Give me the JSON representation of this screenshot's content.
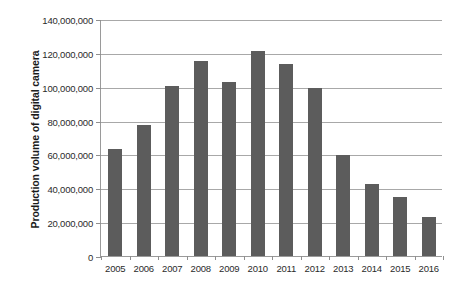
{
  "chart_data": {
    "type": "bar",
    "title": "",
    "xlabel": "",
    "ylabel": "Production volume of digital camera",
    "categories": [
      "2005",
      "2006",
      "2007",
      "2008",
      "2009",
      "2010",
      "2011",
      "2012",
      "2013",
      "2014",
      "2015",
      "2016"
    ],
    "values": [
      63000000,
      77500000,
      100500000,
      115000000,
      103000000,
      121000000,
      113500000,
      99000000,
      59500000,
      42500000,
      35000000,
      23000000
    ],
    "series": [
      {
        "name": "Production volume of digital camera",
        "values": [
          63000000,
          77500000,
          100500000,
          115000000,
          103000000,
          121000000,
          113500000,
          99000000,
          59500000,
          42500000,
          35000000,
          23000000
        ]
      }
    ],
    "ylim": [
      0,
      140000000
    ],
    "ytick_values": [
      0,
      20000000,
      40000000,
      60000000,
      80000000,
      100000000,
      120000000,
      140000000
    ],
    "ytick_labels": [
      "0",
      "20,000,000",
      "40,000,000",
      "60,000,000",
      "80,000,000",
      "100,000,000",
      "120,000,000",
      "140,000,000"
    ],
    "grid": true,
    "legend": "none",
    "bar_color": "#5c5c5c",
    "gridline_color": "#a8a8a8",
    "axis_color": "#9a9a9a"
  }
}
